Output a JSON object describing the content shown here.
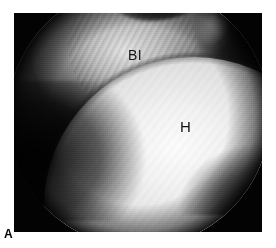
{
  "figure": {
    "panel_letter": "A",
    "modality": "arthroscopic-photograph",
    "frame_background": "#030303",
    "page_background": "#ffffff"
  },
  "image": {
    "field_of_view": "circular-arthroscope-view",
    "regions": [
      {
        "name": "soft-tissue-mass",
        "description": "biceps tendon / labral tissue, upper left and centre"
      },
      {
        "name": "superior-recess-shadow",
        "description": "dark recess at superior margin"
      },
      {
        "name": "capsular-gutter",
        "description": "dark capsular gutter right of labrum"
      },
      {
        "name": "superior-highlight",
        "description": "specular highlight at upper right rim"
      },
      {
        "name": "humeral-head",
        "description": "bright convex articular cartilage of humeral head"
      },
      {
        "name": "inferior-left-recess",
        "description": "dark inferior-left joint recess"
      },
      {
        "name": "inferior-dark-corner",
        "description": "dark corner inferior-right of humeral head"
      }
    ]
  },
  "annotations": [
    {
      "id": "biceps",
      "text": "BI",
      "meaning": "biceps tendon / labrum"
    },
    {
      "id": "humerus",
      "text": "H",
      "meaning": "humeral head"
    }
  ],
  "colors": {
    "frame": "#030303",
    "cartilage_highlight": "#fdfdfd",
    "cartilage_mid": "#cfcfcf",
    "label_text": "#111111",
    "panel_letter": "#000000"
  }
}
